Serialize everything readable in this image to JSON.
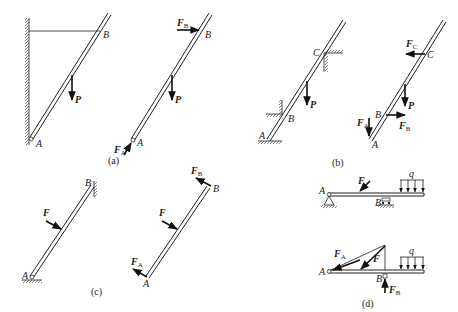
{
  "figure": {
    "panels": [
      {
        "id": "a",
        "caption": "(a)",
        "left": {
          "labels": {
            "A": "A",
            "B": "B"
          },
          "loads": [
            {
              "name": "P",
              "label": "P"
            }
          ],
          "supports": [
            "wall-left",
            "pin-A",
            "cable-B-to-wall"
          ]
        },
        "right": {
          "labels": {
            "A": "A",
            "B": "B"
          },
          "forces": [
            {
              "name": "F_B",
              "main": "F",
              "sub": "B"
            },
            {
              "name": "P",
              "main": "P",
              "sub": ""
            },
            {
              "name": "F_A",
              "main": "F",
              "sub": "A"
            }
          ]
        }
      },
      {
        "id": "b",
        "caption": "(b)",
        "left": {
          "labels": {
            "A": "A",
            "B": "B",
            "C": "C"
          },
          "loads": [
            {
              "name": "P",
              "label": "P"
            }
          ],
          "supports": [
            "ground-A",
            "corner-B",
            "corner-C"
          ]
        },
        "right": {
          "labels": {
            "A": "A",
            "B": "B",
            "C": "C"
          },
          "forces": [
            {
              "name": "F_C",
              "main": "F",
              "sub": "C"
            },
            {
              "name": "P",
              "main": "P",
              "sub": ""
            },
            {
              "name": "F_A",
              "main": "F",
              "sub": "A"
            },
            {
              "name": "F_B",
              "main": "F",
              "sub": "B"
            }
          ]
        }
      },
      {
        "id": "c",
        "caption": "(c)",
        "left": {
          "labels": {
            "A": "A",
            "B": "B"
          },
          "loads": [
            {
              "name": "F",
              "label": "F"
            }
          ],
          "supports": [
            "pin-A",
            "wall-B"
          ]
        },
        "right": {
          "labels": {
            "A": "A",
            "B": "B"
          },
          "forces": [
            {
              "name": "F_B",
              "main": "F",
              "sub": "B"
            },
            {
              "name": "F",
              "main": "F",
              "sub": ""
            },
            {
              "name": "F_A",
              "main": "F",
              "sub": "A"
            }
          ]
        }
      },
      {
        "id": "d",
        "caption": "(d)",
        "top": {
          "labels": {
            "A": "A",
            "B": "B",
            "q": "q"
          },
          "loads": [
            {
              "name": "F",
              "label": "F"
            },
            {
              "name": "q",
              "label": "q"
            }
          ],
          "supports": [
            "pin-A",
            "roller-B"
          ]
        },
        "bottom": {
          "labels": {
            "A": "A",
            "B": "B",
            "q": "q"
          },
          "forces": [
            {
              "name": "F_A",
              "main": "F",
              "sub": "A"
            },
            {
              "name": "F",
              "main": "F",
              "sub": ""
            },
            {
              "name": "F_B",
              "main": "F",
              "sub": "B"
            },
            {
              "name": "q",
              "main": "q",
              "sub": ""
            }
          ]
        }
      }
    ]
  },
  "colors": {
    "ink": "#222222",
    "background": "#ffffff"
  }
}
